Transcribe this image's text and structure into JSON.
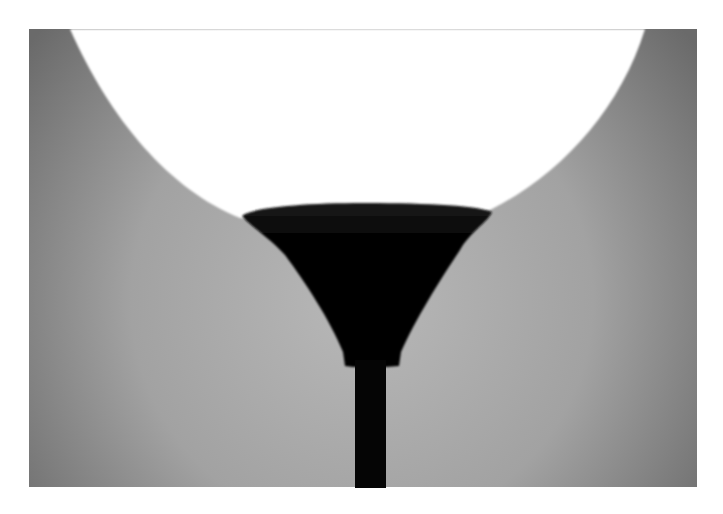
{
  "image": {
    "subject": "floor lamp silhouette against glowing light",
    "colors": {
      "page_background": "#ffffff",
      "wall_dark": "#6e6e6e",
      "wall_light": "#b4b4b4",
      "glow": "#ffffff",
      "lamp": "#050505"
    }
  }
}
